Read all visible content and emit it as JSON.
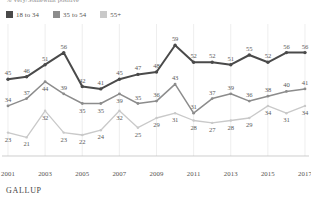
{
  "subtitle": "% Very/Somewhat positive",
  "brand": "GALLUP",
  "legend": {
    "items": [
      {
        "label": "18 to 34",
        "color": "#4a4a4a"
      },
      {
        "label": "35 to 54",
        "color": "#8c8c8c"
      },
      {
        "label": "55+",
        "color": "#c9c9c9"
      }
    ]
  },
  "axis": {
    "xticks": [
      "2001",
      "2003",
      "2005",
      "2007",
      "2009",
      "2011",
      "2013",
      "2015",
      "2017"
    ]
  },
  "chart_data": {
    "type": "line",
    "title": "",
    "subtitle": "% Very/Somewhat positive",
    "xlabel": "",
    "ylabel": "",
    "ylim": [
      15,
      62
    ],
    "grid": true,
    "legend_position": "top-left",
    "x": [
      2001,
      2002,
      2003,
      2004,
      2005,
      2006,
      2007,
      2008,
      2009,
      2010,
      2011,
      2012,
      2013,
      2014,
      2015,
      2016,
      2017
    ],
    "xticks": [
      "2001",
      "2003",
      "2005",
      "2007",
      "2009",
      "2011",
      "2013",
      "2015",
      "2017"
    ],
    "series": [
      {
        "name": "18 to 34",
        "color": "#4a4a4a",
        "values": [
          45,
          46,
          51,
          56,
          42,
          41,
          45,
          47,
          48,
          59,
          52,
          52,
          51,
          55,
          52,
          56,
          56
        ]
      },
      {
        "name": "35 to 54",
        "color": "#8c8c8c",
        "values": [
          34,
          37,
          44,
          39,
          35,
          35,
          39,
          35,
          36,
          43,
          31,
          37,
          39,
          36,
          38,
          40,
          41
        ]
      },
      {
        "name": "55+",
        "color": "#c9c9c9",
        "values": [
          23,
          21,
          32,
          23,
          22,
          24,
          32,
          25,
          29,
          31,
          28,
          27,
          28,
          29,
          34,
          31,
          34
        ]
      }
    ]
  }
}
